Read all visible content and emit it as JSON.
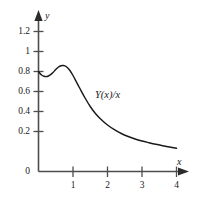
{
  "chart_data": {
    "type": "line",
    "title": "",
    "subtitle": "",
    "xlabel": "x",
    "ylabel": "y",
    "xlim": [
      0,
      4.15
    ],
    "ylim": [
      0,
      1.25
    ],
    "grid": false,
    "legend": null,
    "axis_style": "arrowed-axes",
    "series": [
      {
        "name": "Y(x)/x",
        "annotation": "Y(x)/x",
        "color": "#1a1a1a",
        "x": [
          0.0,
          0.08,
          0.16,
          0.25,
          0.33,
          0.42,
          0.5,
          0.58,
          0.65,
          0.72,
          0.8,
          0.9,
          1.0,
          1.1,
          1.2,
          1.35,
          1.5,
          1.65,
          1.8,
          2.0,
          2.2,
          2.4,
          2.6,
          2.8,
          3.0,
          3.2,
          3.4,
          3.6,
          3.8,
          4.0
        ],
        "y": [
          1.0,
          0.968,
          0.952,
          0.95,
          0.963,
          0.99,
          1.02,
          1.045,
          1.058,
          1.06,
          1.05,
          1.015,
          0.96,
          0.895,
          0.83,
          0.735,
          0.65,
          0.58,
          0.525,
          0.465,
          0.418,
          0.38,
          0.35,
          0.325,
          0.305,
          0.288,
          0.272,
          0.258,
          0.245,
          0.232
        ]
      }
    ],
    "x_ticks": [
      {
        "value": 0,
        "label": ""
      },
      {
        "value": 1,
        "label": "1"
      },
      {
        "value": 2,
        "label": "2"
      },
      {
        "value": 3,
        "label": "3"
      },
      {
        "value": 4,
        "label": "4"
      }
    ],
    "y_ticks": [
      {
        "value": 0,
        "label": "0"
      },
      {
        "value": 0.2,
        "label": "0.2"
      },
      {
        "value": 0.4,
        "label": "0.4"
      },
      {
        "value": 0.6,
        "label": "0.6"
      },
      {
        "value": 0.8,
        "label": "0.8"
      },
      {
        "value": 1.0,
        "label": "1"
      },
      {
        "value": 1.2,
        "label": "1.2"
      }
    ],
    "colors": {
      "curve": "#1a1a1a",
      "axis": "#4d4d4d",
      "text": "#1a1a1a",
      "background": "#ffffff"
    }
  },
  "labels": {
    "x_axis_name": "x",
    "y_axis_name": "y",
    "curve_annotation": "Y(x)/x",
    "y_tick_0": "0",
    "y_tick_02": "0.2",
    "y_tick_04": "0.4",
    "y_tick_06": "0.6",
    "y_tick_08": "0.8",
    "y_tick_1": "1",
    "y_tick_12": "1.2",
    "x_tick_1": "1",
    "x_tick_2": "2",
    "x_tick_3": "3",
    "x_tick_4": "4"
  }
}
